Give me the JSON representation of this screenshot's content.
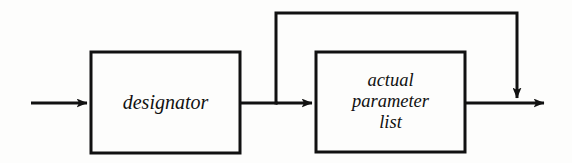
{
  "diagram": {
    "kind": "syntax-railroad-diagram",
    "background_color": "#fdfdfc",
    "stroke_color": "#111111",
    "stroke_width": 3,
    "nodes": [
      {
        "id": "designator",
        "shape": "rectangle",
        "label_lines": [
          "designator"
        ],
        "x": 91,
        "y": 52,
        "width": 149,
        "height": 101
      },
      {
        "id": "actual-parameter-list",
        "shape": "rectangle",
        "label_lines": [
          "actual",
          "parameter",
          "list"
        ],
        "x": 316,
        "y": 52,
        "width": 149,
        "height": 100
      }
    ],
    "labels": {
      "designator": "designator",
      "actual": "actual",
      "parameter": "parameter",
      "list": "list"
    },
    "edges": [
      {
        "id": "entry",
        "from": "start",
        "to": "designator",
        "arrow": true,
        "path": "M 31 103 L 91 103"
      },
      {
        "id": "designator-to-branch",
        "from": "designator",
        "to": "branch-point",
        "arrow": false,
        "path": "M 240 103 L 276 103"
      },
      {
        "id": "branch-to-actual-parameter-list",
        "from": "branch-point",
        "to": "actual-parameter-list",
        "arrow": true,
        "path": "M 276 103 L 316 103"
      },
      {
        "id": "bypass-loop",
        "from": "branch-point",
        "to": "merge-point",
        "arrow": true,
        "path": "M 276 103 L 276 13 L 517 13 L 517 102"
      },
      {
        "id": "actual-parameter-list-to-exit",
        "from": "actual-parameter-list",
        "to": "end",
        "arrow": true,
        "path": "M 465 103 L 548 103"
      }
    ],
    "junctions": [
      {
        "id": "branch-point",
        "x": 276,
        "y": 103
      },
      {
        "id": "merge-point",
        "x": 517,
        "y": 103
      }
    ]
  }
}
